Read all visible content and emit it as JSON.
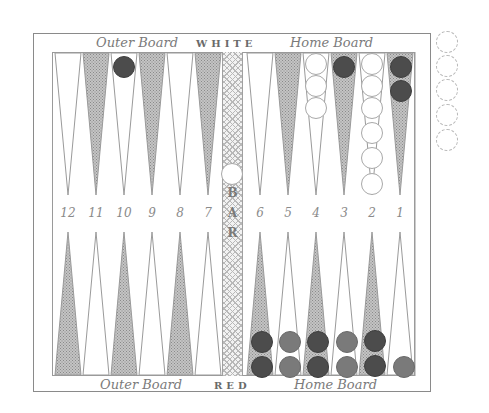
{
  "board": {
    "top_labels": {
      "left": "Outer Board",
      "center": "WHITE",
      "right": "Home Board"
    },
    "bottom_labels": {
      "left": "Outer Board",
      "center": "RED",
      "right": "Home Board"
    },
    "bar_letters": [
      "B",
      "A",
      "R"
    ],
    "point_numbers_left": [
      "12",
      "11",
      "10",
      "9",
      "8",
      "7"
    ],
    "point_numbers_right": [
      "6",
      "5",
      "4",
      "3",
      "2",
      "1"
    ],
    "colors": {
      "white_checker": "#ffffff",
      "dark_checker": "#4c4c4c",
      "red_checker": "#7a7a7a",
      "shaded_point": "#9c9c9c",
      "frame": "#8a8a8a"
    }
  },
  "position": {
    "top": [
      {
        "point": 10,
        "color": "dark",
        "count": 1
      },
      {
        "point": 4,
        "color": "white",
        "count": 3
      },
      {
        "point": 3,
        "color": "dark",
        "count": 1
      },
      {
        "point": 2,
        "color": "white",
        "count": 6
      },
      {
        "point": 1,
        "color": "dark",
        "count": 2
      }
    ],
    "bottom": [
      {
        "point": 6,
        "color": "dark",
        "count": 2
      },
      {
        "point": 5,
        "color": "red",
        "count": 2
      },
      {
        "point": 4,
        "color": "dark",
        "count": 2
      },
      {
        "point": 3,
        "color": "red",
        "count": 2
      },
      {
        "point": 2,
        "color": "dark",
        "count": 2
      },
      {
        "point": 1,
        "color": "red",
        "count": 1
      }
    ],
    "bar": [
      {
        "color": "white",
        "count": 1
      }
    ],
    "borne_off_tray": {
      "slots": 5,
      "filled": 0
    }
  }
}
